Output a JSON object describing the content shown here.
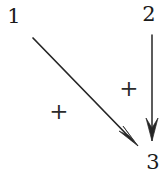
{
  "diagram": {
    "type": "signed-directed-graph",
    "background_color": "#ffffff",
    "stroke_color": "#262626",
    "nodes": [
      {
        "id": "1",
        "label": "1",
        "x": 14,
        "y": 17
      },
      {
        "id": "3",
        "label": "3",
        "x": 149,
        "y": 15
      },
      {
        "id": "2",
        "label": "2",
        "x": 153,
        "y": 163
      }
    ],
    "edges": [
      {
        "id": "edge-1-to-2",
        "from": "1",
        "to": "2",
        "sign": "+",
        "sign_label": "+",
        "sign_x": 59,
        "sign_y": 113,
        "x1": 33,
        "y1": 38,
        "x2": 138,
        "y2": 146
      },
      {
        "id": "edge-3-to-2",
        "from": "3",
        "to": "2",
        "sign": "+",
        "sign_label": "+",
        "sign_x": 129,
        "sign_y": 90,
        "x1": 152,
        "y1": 35,
        "x2": 152,
        "y2": 141
      }
    ]
  }
}
